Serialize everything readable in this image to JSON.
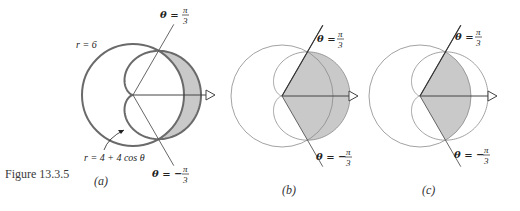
{
  "figure": {
    "caption": "Figure 13.3.5",
    "panels": [
      {
        "id": "a",
        "label": "(a)"
      },
      {
        "id": "b",
        "label": "(b)"
      },
      {
        "id": "c",
        "label": "(c)"
      }
    ]
  },
  "labels": {
    "circle": "r = 6",
    "cardioid": "r = 4 + 4 cos θ",
    "theta_pos": "θ =",
    "theta_neg": "θ = −",
    "pi": "π",
    "three": "3"
  },
  "colors": {
    "stroke_a": "#6a6a6a",
    "stroke_bc": "#8a8a8a",
    "shade": "#c9c9c9",
    "line": "#555555"
  },
  "chart_data": {
    "type": "polar-diagram",
    "curves": [
      {
        "name": "circle",
        "equation": "r = 6"
      },
      {
        "name": "cardioid",
        "equation": "r = 4 + 4cos(theta)"
      }
    ],
    "rays": [
      {
        "theta": "pi/3"
      },
      {
        "theta": "-pi/3"
      }
    ],
    "panels": [
      {
        "id": "a",
        "shaded": "region inside cardioid and outside circle, -pi/3..pi/3"
      },
      {
        "id": "b",
        "shaded": "sector of cardioid, -pi/3..pi/3"
      },
      {
        "id": "c",
        "shaded": "sector of circle r=6, -pi/3..pi/3"
      }
    ]
  }
}
